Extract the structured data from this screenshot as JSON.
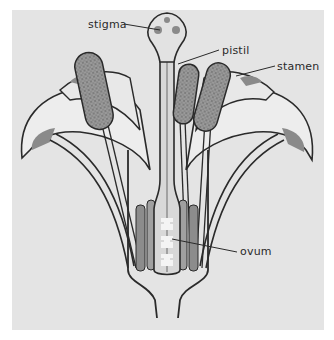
{
  "diagram": {
    "labels": [
      {
        "id": "stigma",
        "text": "stigma",
        "x": 88,
        "y": 19
      },
      {
        "id": "pistil",
        "text": "pistil",
        "x": 222,
        "y": 47
      },
      {
        "id": "stamen",
        "text": "stamen",
        "x": 277,
        "y": 63
      },
      {
        "id": "ovum",
        "text": "ovum",
        "x": 240,
        "y": 248
      }
    ],
    "colors": {
      "background": "#e4e4e4",
      "outline": "#2a2a2a",
      "petal_fill": "#eeeeee",
      "anther_fill": "#8a8a8a",
      "shadow": "#9a9a9a",
      "ovum_fill": "#f4f4f4"
    }
  }
}
